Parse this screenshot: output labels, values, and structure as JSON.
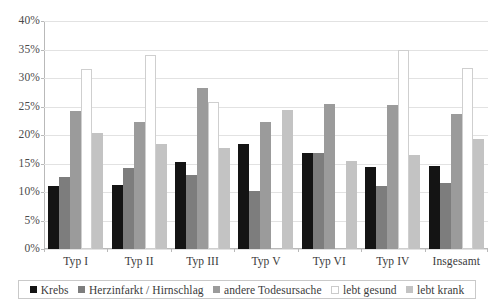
{
  "chart_data": {
    "type": "bar",
    "title": "",
    "subtitle": "",
    "xlabel": "",
    "ylabel": "",
    "ylim": [
      0,
      40
    ],
    "ytick_values": [
      0,
      5,
      10,
      15,
      20,
      25,
      30,
      35,
      40
    ],
    "ytick_labels": [
      "0%",
      "5%",
      "10%",
      "15%",
      "20%",
      "25%",
      "30%",
      "35%",
      "40%"
    ],
    "grid": true,
    "legend_position": "bottom",
    "categories": [
      "Typ I",
      "Typ II",
      "Typ III",
      "Typ V",
      "Typ VI",
      "Typ IV",
      "Insgesamt"
    ],
    "series": [
      {
        "name": "Krebs",
        "color": "#141414",
        "values": [
          11.0,
          11.3,
          15.3,
          18.4,
          16.8,
          14.4,
          14.5
        ]
      },
      {
        "name": "Herzinfarkt / Hirnschlag",
        "color": "#7d7d7d",
        "values": [
          12.6,
          14.2,
          13.0,
          10.1,
          16.8,
          11.0,
          11.5
        ]
      },
      {
        "name": "andere Todesursache",
        "color": "#9b9b9b",
        "values": [
          24.3,
          22.2,
          28.3,
          22.3,
          25.5,
          25.2,
          23.6
        ]
      },
      {
        "name": "lebt gesund",
        "color": "#ffffff",
        "values": [
          31.6,
          34.0,
          25.8,
          null,
          null,
          35.0,
          31.7
        ]
      },
      {
        "name": "lebt krank",
        "color": "#c3c3c3",
        "values": [
          20.3,
          18.5,
          17.7,
          24.4,
          15.5,
          16.5,
          19.3
        ]
      }
    ]
  },
  "axis": {
    "y_labels": [
      "40%",
      "35%",
      "30%",
      "25%",
      "20%",
      "15%",
      "10%",
      "5%",
      "0%"
    ],
    "x_labels": [
      "Typ I",
      "Typ II",
      "Typ III",
      "Typ V",
      "Typ VI",
      "Typ IV",
      "Insgesamt"
    ]
  },
  "legend": {
    "items": [
      {
        "label": "Krebs",
        "swatch": "legend-swatch-krebs"
      },
      {
        "label": "Herzinfarkt / Hirnschlag",
        "swatch": "legend-swatch-herzinfarkt"
      },
      {
        "label": "andere Todesursache",
        "swatch": "legend-swatch-andere-todesursache"
      },
      {
        "label": "lebt gesund",
        "swatch": "legend-swatch-lebt-gesund"
      },
      {
        "label": "lebt krank",
        "swatch": "legend-swatch-lebt-krank"
      }
    ]
  }
}
